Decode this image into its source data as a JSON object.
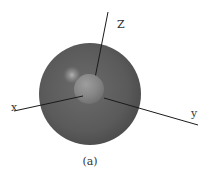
{
  "figure": {
    "caption": "(a)",
    "axes": {
      "z_label": "Z",
      "x_label": "x",
      "y_label": "y"
    },
    "outer_sphere": {
      "cx": 90,
      "cy": 94,
      "r": 51,
      "color": "#5a5a5a"
    },
    "inner_sphere": {
      "cx": 89,
      "cy": 89,
      "r": 15,
      "color": "#8a8a8a"
    },
    "highlight": {
      "cx": 72,
      "cy": 75,
      "r": 9
    },
    "colors": {
      "axis": "#1a1a1a",
      "background": "#ffffff"
    }
  }
}
